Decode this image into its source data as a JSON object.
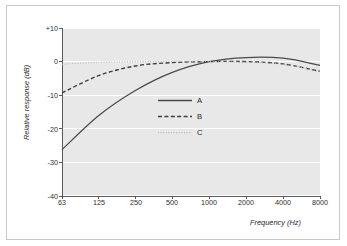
{
  "chart_data": {
    "type": "line",
    "title": "",
    "xlabel": "Frequency (Hz)",
    "ylabel": "Relative response (dB)",
    "xscale": "log",
    "xlim": [
      63,
      8000
    ],
    "ylim": [
      -40,
      10
    ],
    "grid": true,
    "grid_axis": "y",
    "legend_position": "center",
    "xticks": [
      63,
      125,
      250,
      500,
      1000,
      2000,
      4000,
      8000
    ],
    "xtick_labels": [
      "63",
      "125",
      "250",
      "500",
      "1000",
      "2000",
      "4000",
      "8000"
    ],
    "yticks": [
      10,
      0,
      -10,
      -20,
      -30,
      -40
    ],
    "ytick_labels": [
      "+10",
      "0",
      "-10",
      "-20",
      "-30",
      "-40"
    ],
    "x": [
      63,
      125,
      250,
      500,
      1000,
      2000,
      4000,
      8000
    ],
    "series": [
      {
        "name": "A",
        "style": "solid",
        "color": "#4a4a4a",
        "values": [
          -26.2,
          -16.1,
          -8.6,
          -3.2,
          0.0,
          1.2,
          1.0,
          -1.1
        ]
      },
      {
        "name": "B",
        "style": "dashed",
        "color": "#3c3c3c",
        "values": [
          -9.3,
          -4.2,
          -1.3,
          -0.3,
          0.0,
          0.0,
          -0.7,
          -2.9
        ]
      },
      {
        "name": "C",
        "style": "dotted",
        "color": "#b4b4b4",
        "values": [
          -0.8,
          -0.2,
          0.0,
          0.0,
          0.0,
          -0.2,
          -0.8,
          -3.0
        ]
      }
    ]
  },
  "legend": {
    "entries": [
      {
        "label": "A",
        "style": "solid"
      },
      {
        "label": "B",
        "style": "dashed"
      },
      {
        "label": "C",
        "style": "dotted"
      }
    ]
  },
  "axes": {
    "y_title": "Relative response (dB)",
    "x_title": "Frequency (Hz)",
    "y_ticks": [
      "+10",
      "0",
      "-10",
      "-20",
      "-30",
      "-40"
    ],
    "x_ticks": [
      "63",
      "125",
      "250",
      "500",
      "1000",
      "2000",
      "4000",
      "8000"
    ]
  },
  "colors": {
    "plot_background": "#e8e8e8",
    "gridline": "#ffffff",
    "frame_border": "#c9c9c9",
    "series_a": "#4a4a4a",
    "series_b": "#3c3c3c",
    "series_c": "#b4b4b4",
    "text": "#1f1f1f"
  }
}
